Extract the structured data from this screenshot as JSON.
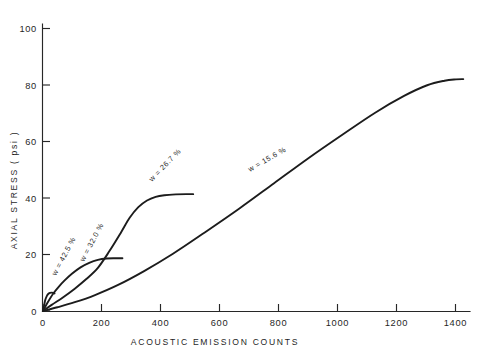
{
  "chart_data": {
    "type": "line",
    "title": "",
    "xlabel": "ACOUSTIC  EMISSION  COUNTS",
    "ylabel": "AXIAL  STRESS  ( psi )",
    "xlim": [
      0,
      1480
    ],
    "ylim": [
      0,
      108
    ],
    "grid": false,
    "legend": "inline-annotations",
    "xticks": [
      0,
      200,
      400,
      600,
      800,
      1000,
      1200,
      1400
    ],
    "xticklabels": [
      "0",
      "200",
      "400",
      "600",
      "800",
      "1000",
      "1200",
      "1400"
    ],
    "yticks": [
      0,
      20,
      40,
      60,
      80,
      100
    ],
    "yticklabels": [
      "0",
      "20",
      "40",
      "60",
      "80",
      "100"
    ],
    "series": [
      {
        "name": "w = 42.5 %",
        "label": "w = 42.5 %",
        "label_angle": -62,
        "points": [
          [
            0,
            0
          ],
          [
            4,
            2.2
          ],
          [
            8,
            4.2
          ],
          [
            13,
            5.6
          ],
          [
            18,
            6.4
          ],
          [
            24,
            6.8
          ],
          [
            30,
            6.9
          ],
          [
            36,
            6.8
          ],
          [
            40,
            6.6
          ]
        ]
      },
      {
        "name": "w = 32.0 %",
        "label": "w = 32.0 %",
        "label_angle": -62,
        "points": [
          [
            0,
            0
          ],
          [
            15,
            3.0
          ],
          [
            35,
            6.5
          ],
          [
            55,
            9.2
          ],
          [
            75,
            11.5
          ],
          [
            100,
            14.0
          ],
          [
            130,
            16.4
          ],
          [
            160,
            18.1
          ],
          [
            190,
            19.2
          ],
          [
            220,
            19.7
          ],
          [
            250,
            19.8
          ],
          [
            275,
            19.8
          ]
        ]
      },
      {
        "name": "w = 26.7 %",
        "label": "w = 26.7 %",
        "label_angle": -46,
        "points": [
          [
            0,
            0
          ],
          [
            30,
            2.3
          ],
          [
            70,
            5.2
          ],
          [
            110,
            8.4
          ],
          [
            150,
            12.0
          ],
          [
            190,
            16.2
          ],
          [
            230,
            22.5
          ],
          [
            270,
            29.5
          ],
          [
            300,
            35.0
          ],
          [
            330,
            39.0
          ],
          [
            360,
            41.5
          ],
          [
            390,
            42.9
          ],
          [
            420,
            43.5
          ],
          [
            460,
            43.8
          ],
          [
            500,
            43.9
          ],
          [
            520,
            43.9
          ]
        ]
      },
      {
        "name": "w = 15.6 %",
        "label": "w = 15.6 %",
        "label_angle": -30,
        "points": [
          [
            0,
            0
          ],
          [
            50,
            1.4
          ],
          [
            110,
            3.3
          ],
          [
            180,
            6.0
          ],
          [
            260,
            9.8
          ],
          [
            350,
            15.0
          ],
          [
            450,
            21.5
          ],
          [
            560,
            29.5
          ],
          [
            680,
            38.5
          ],
          [
            800,
            48.0
          ],
          [
            920,
            57.5
          ],
          [
            1040,
            66.5
          ],
          [
            1150,
            74.5
          ],
          [
            1250,
            80.8
          ],
          [
            1330,
            84.8
          ],
          [
            1390,
            86.5
          ],
          [
            1430,
            87.0
          ],
          [
            1455,
            87.1
          ]
        ]
      }
    ],
    "annotations": [
      {
        "text": "w = 42.5 %",
        "x_px": 56,
        "y_px": 276,
        "rotation": -62
      },
      {
        "text": "w = 32.0 %",
        "x_px": 84,
        "y_px": 262,
        "rotation": -62
      },
      {
        "text": "w = 26.7 %",
        "x_px": 152,
        "y_px": 182,
        "rotation": -46
      },
      {
        "text": "w = 15.6 %",
        "x_px": 250,
        "y_px": 172,
        "rotation": -30
      }
    ]
  },
  "axes": {
    "y_title": "AXIAL  STRESS  ( psi )",
    "x_title": "ACOUSTIC   EMISSION   COUNTS",
    "y_labels": [
      "100",
      "80",
      "60",
      "40",
      "20",
      "0"
    ],
    "x_labels": [
      "0",
      "200",
      "400",
      "600",
      "800",
      "1000",
      "1200",
      "1400"
    ]
  },
  "colors": {
    "ink": "#1c1c1c",
    "axis": "#272727",
    "background": "#ffffff"
  }
}
